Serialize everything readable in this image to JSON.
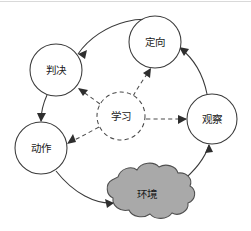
{
  "diagram": {
    "type": "cycle-diagram",
    "title": "",
    "background_color": "#ffffff",
    "stroke_color": "#3a3a3a",
    "cloud_fill_color": "#a9a9a9",
    "nodes": [
      {
        "id": "orient",
        "label": "定向",
        "shape": "circle",
        "style": "solid",
        "cx": 155,
        "cy": 42,
        "r": 26,
        "fill": "#ffffff"
      },
      {
        "id": "decide",
        "label": "判决",
        "shape": "circle",
        "style": "solid",
        "cx": 56,
        "cy": 70,
        "r": 26,
        "fill": "#ffffff"
      },
      {
        "id": "act",
        "label": "动作",
        "shape": "circle",
        "style": "solid",
        "cx": 41,
        "cy": 148,
        "r": 26,
        "fill": "#ffffff"
      },
      {
        "id": "observe",
        "label": "观察",
        "shape": "circle",
        "style": "solid",
        "cx": 212,
        "cy": 119,
        "r": 25,
        "fill": "#ffffff"
      },
      {
        "id": "learn",
        "label": "学习",
        "shape": "circle",
        "style": "dashed",
        "cx": 121,
        "cy": 116,
        "r": 24,
        "fill": "#ffffff"
      },
      {
        "id": "environment",
        "label": "环境",
        "shape": "cloud",
        "style": "solid",
        "cx": 145,
        "cy": 194,
        "fill": "#a9a9a9"
      }
    ],
    "edges": [
      {
        "id": "orient-to-decide",
        "from": "orient",
        "to": "decide",
        "style": "solid",
        "arrow": true
      },
      {
        "id": "decide-to-act",
        "from": "decide",
        "to": "act",
        "style": "solid",
        "arrow": true
      },
      {
        "id": "act-to-environment",
        "from": "act",
        "to": "environment",
        "style": "solid",
        "arrow": true
      },
      {
        "id": "environment-to-observe",
        "from": "environment",
        "to": "observe",
        "style": "solid",
        "arrow": true
      },
      {
        "id": "observe-to-orient",
        "from": "observe",
        "to": "orient",
        "style": "solid",
        "arrow": true
      },
      {
        "id": "learn-to-orient",
        "from": "learn",
        "to": "orient",
        "style": "dashed",
        "arrow": true
      },
      {
        "id": "learn-to-decide",
        "from": "learn",
        "to": "decide",
        "style": "dashed",
        "arrow": true
      },
      {
        "id": "learn-to-act",
        "from": "learn",
        "to": "act",
        "style": "dashed",
        "arrow": true
      },
      {
        "id": "learn-to-observe",
        "from": "learn",
        "to": "observe",
        "style": "dashed",
        "arrow": true
      }
    ]
  }
}
